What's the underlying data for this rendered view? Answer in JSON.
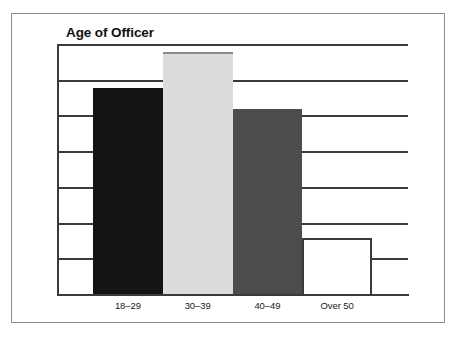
{
  "chart_data": {
    "type": "bar",
    "title": "Age of Officer",
    "xlabel": "",
    "ylabel": "",
    "categories": [
      "18–29",
      "30–39",
      "40–49",
      "Over 50"
    ],
    "values": [
      29,
      34,
      26,
      8
    ],
    "value_labels": [
      "29%",
      "34%",
      "26%",
      "8%"
    ],
    "ylim": [
      0,
      35
    ],
    "ytick_values": [
      0,
      5,
      10,
      15,
      20,
      25,
      30,
      35
    ],
    "ytick_labels": [
      "0%",
      "5%",
      "10%",
      "15%",
      "20%",
      "25%",
      "30%",
      "35%"
    ],
    "grid": true,
    "grid_axis": "y",
    "legend": false,
    "legend_position": "none",
    "bar_gap": 0,
    "series": [
      {
        "name": "Age of Officer",
        "values": [
          29,
          34,
          26,
          8
        ]
      }
    ],
    "bar_colors": [
      "#141414",
      "#dcdcdc",
      "#4c4c4c",
      "#ffffff"
    ],
    "bar_edge_colors": [
      "#141414",
      "#8a8a8a",
      "#4c4c4c",
      "#3a3a3a"
    ],
    "colors": {
      "axis": "#3a3a3a",
      "grid": "#3a3a3a",
      "text": "#1a1a1a",
      "title": "#111111",
      "frame": "#8c8c8c",
      "background": "#ffffff"
    }
  }
}
